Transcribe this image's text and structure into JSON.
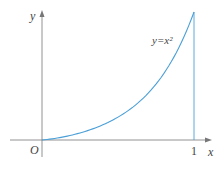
{
  "chart_data": {
    "type": "line",
    "title": "",
    "xlabel": "x",
    "ylabel": "y",
    "origin_label": "O",
    "x_ticks": [
      "1"
    ],
    "series": [
      {
        "name": "y=x^2",
        "label": "y=x²",
        "x": [
          0,
          0.1,
          0.2,
          0.3,
          0.4,
          0.5,
          0.6,
          0.7,
          0.8,
          0.9,
          1.0
        ],
        "values": [
          0,
          0.01,
          0.04,
          0.09,
          0.16,
          0.25,
          0.36,
          0.49,
          0.64,
          0.81,
          1.0
        ]
      }
    ],
    "annotations": [
      {
        "type": "vertical-line",
        "x": 1,
        "from_y": 0,
        "to_y": 1
      }
    ],
    "xlim": [
      0,
      1
    ],
    "ylim": [
      0,
      1
    ],
    "grid": false,
    "legend": "none",
    "colors": {
      "curve": "#4a9fd8",
      "axes": "#666666"
    }
  }
}
